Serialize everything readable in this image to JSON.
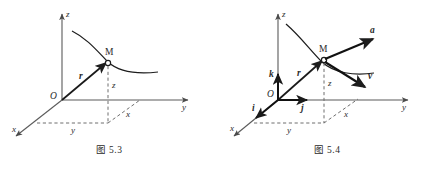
{
  "page": {
    "background_color": "#ffffff",
    "ink_color": "#2b2b2b",
    "axis_color": "#555555",
    "dash_color": "#6b6b6b"
  },
  "figures": [
    {
      "id": "fig-5-3",
      "caption": "图 5.3",
      "axes": [
        {
          "name": "z-axis",
          "label": "z"
        },
        {
          "name": "y-axis",
          "label": "y"
        },
        {
          "name": "x-axis",
          "label": "x"
        }
      ],
      "origin_label": "O",
      "point_label": "M",
      "vectors": [
        {
          "name": "position-vector",
          "label": "r"
        }
      ],
      "projection_labels": [
        {
          "name": "z-drop-label",
          "label": "z"
        },
        {
          "name": "y-projection-label",
          "label": "y"
        },
        {
          "name": "x-projection-label",
          "label": "x"
        }
      ],
      "curve_name": "trajectory-curve"
    },
    {
      "id": "fig-5-4",
      "caption": "图 5.4",
      "axes": [
        {
          "name": "z-axis",
          "label": "z"
        },
        {
          "name": "y-axis",
          "label": "y"
        },
        {
          "name": "x-axis",
          "label": "x"
        }
      ],
      "origin_label": "O",
      "point_label": "M",
      "vectors": [
        {
          "name": "position-vector",
          "label": "r"
        },
        {
          "name": "acceleration-vector",
          "label": "a"
        },
        {
          "name": "velocity-vector",
          "label": "v"
        },
        {
          "name": "unit-vector-i",
          "label": "i"
        },
        {
          "name": "unit-vector-j",
          "label": "j"
        },
        {
          "name": "unit-vector-k",
          "label": "k"
        }
      ],
      "projection_labels": [
        {
          "name": "z-drop-label",
          "label": "z"
        },
        {
          "name": "y-projection-label",
          "label": "y"
        },
        {
          "name": "x-projection-label",
          "label": "x"
        }
      ],
      "curve_name": "trajectory-curve"
    }
  ]
}
